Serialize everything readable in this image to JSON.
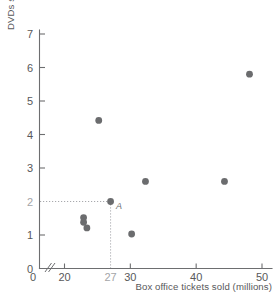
{
  "chart_data": {
    "type": "scatter",
    "title": "",
    "xlabel": "Box office tickets sold (millions)",
    "ylabel": "DVDs sold (millions)",
    "xlim": [
      18,
      51
    ],
    "ylim": [
      0,
      7.2
    ],
    "x_ticks": [
      {
        "value": 0,
        "label": "0",
        "muted": false,
        "origin": true
      },
      {
        "value": 20,
        "label": "20",
        "muted": false
      },
      {
        "value": 27,
        "label": "27",
        "muted": true
      },
      {
        "value": 30,
        "label": "30",
        "muted": false
      },
      {
        "value": 40,
        "label": "40",
        "muted": false
      },
      {
        "value": 50,
        "label": "50",
        "muted": false
      }
    ],
    "y_ticks": [
      {
        "value": 0,
        "label": "0",
        "muted": false
      },
      {
        "value": 1,
        "label": "1",
        "muted": false
      },
      {
        "value": 2,
        "label": "2",
        "muted": true
      },
      {
        "value": 3,
        "label": "3",
        "muted": false
      },
      {
        "value": 4,
        "label": "4",
        "muted": false
      },
      {
        "value": 5,
        "label": "5",
        "muted": false
      },
      {
        "value": 6,
        "label": "6",
        "muted": false
      },
      {
        "value": 7,
        "label": "7",
        "muted": false
      }
    ],
    "axis_break": {
      "axis": "x",
      "symbol": "//",
      "note": "double slash break between 0 and 20"
    },
    "grid": false,
    "legend": null,
    "point_color": "#6b6c6e",
    "guide_color": "#a8a9ad",
    "axis_color": "#6d6e70",
    "points": [
      {
        "x": 22.9,
        "y": 1.52,
        "label": ""
      },
      {
        "x": 22.9,
        "y": 1.38,
        "label": ""
      },
      {
        "x": 23.4,
        "y": 1.21,
        "label": ""
      },
      {
        "x": 25.2,
        "y": 4.42,
        "label": ""
      },
      {
        "x": 27.0,
        "y": 2.0,
        "label": "A"
      },
      {
        "x": 30.2,
        "y": 1.03,
        "label": ""
      },
      {
        "x": 32.3,
        "y": 2.6,
        "label": ""
      },
      {
        "x": 44.3,
        "y": 2.6,
        "label": ""
      },
      {
        "x": 48.1,
        "y": 5.8,
        "label": ""
      }
    ],
    "guides": [
      {
        "from": {
          "x": 18,
          "y": 2.0
        },
        "to": {
          "x": 27,
          "y": 2.0
        },
        "orientation": "horizontal"
      },
      {
        "from": {
          "x": 27,
          "y": 0
        },
        "to": {
          "x": 27,
          "y": 2.0
        },
        "orientation": "vertical"
      }
    ],
    "annotations": [
      {
        "text": "A",
        "x": 27.0,
        "y": 2.0,
        "style": "italic",
        "placement": "right-below"
      }
    ]
  }
}
